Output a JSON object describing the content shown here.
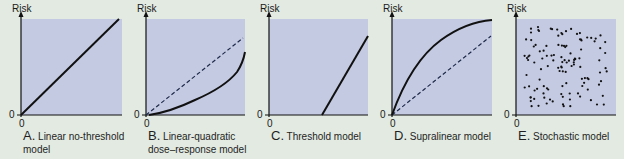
{
  "figure": {
    "colors": {
      "background": "#e2eae1",
      "plot_fill": "#c4cae2",
      "line": "#111111",
      "dashed_reference": "#1e2a4a"
    },
    "panels": [
      {
        "letter": "A.",
        "title_line1": "Linear no-threshold",
        "title_line2": "model",
        "ylabel": "Risk",
        "y_tick": "0",
        "x_tick": "0"
      },
      {
        "letter": "B.",
        "title_line1": "Linear-quadratic",
        "title_line2": "dose–response model",
        "ylabel": "Risk",
        "y_tick": "0",
        "x_tick": "0"
      },
      {
        "letter": "C.",
        "title_line1": "Threshold model",
        "title_line2": "",
        "ylabel": "Risk",
        "y_tick": "0",
        "x_tick": "0"
      },
      {
        "letter": "D.",
        "title_line1": "Supralinear model",
        "title_line2": "",
        "ylabel": "Risk",
        "y_tick": "0",
        "x_tick": "0"
      },
      {
        "letter": "E.",
        "title_line1": "Stochastic model",
        "title_line2": "",
        "ylabel": "Risk",
        "y_tick": "0",
        "x_tick": "0"
      }
    ]
  },
  "chart_data": [
    {
      "type": "line",
      "title": "A. Linear no-threshold model",
      "xlabel": "",
      "ylabel": "Risk",
      "xlim": [
        0,
        1
      ],
      "ylim": [
        0,
        1
      ],
      "series": [
        {
          "name": "risk",
          "style": "solid",
          "x": [
            0,
            1
          ],
          "y": [
            0,
            1
          ]
        }
      ]
    },
    {
      "type": "line",
      "title": "B. Linear-quadratic dose–response model",
      "xlabel": "",
      "ylabel": "Risk",
      "xlim": [
        0,
        1
      ],
      "ylim": [
        0,
        1
      ],
      "series": [
        {
          "name": "linear reference",
          "style": "dashed",
          "x": [
            0,
            1
          ],
          "y": [
            0,
            0.84
          ]
        },
        {
          "name": "linear-quadratic",
          "style": "solid",
          "x": [
            0,
            0.1,
            0.3,
            0.5,
            0.7,
            0.85,
            0.95,
            1.0
          ],
          "y": [
            0,
            0.01,
            0.07,
            0.15,
            0.26,
            0.37,
            0.48,
            0.6
          ]
        }
      ]
    },
    {
      "type": "line",
      "title": "C. Threshold model",
      "xlabel": "",
      "ylabel": "Risk",
      "xlim": [
        0,
        1
      ],
      "ylim": [
        0,
        1
      ],
      "series": [
        {
          "name": "risk",
          "style": "solid",
          "x": [
            0,
            0.55,
            1.0
          ],
          "y": [
            0,
            0,
            0.84
          ]
        }
      ]
    },
    {
      "type": "line",
      "title": "D. Supralinear model",
      "xlabel": "",
      "ylabel": "Risk",
      "xlim": [
        0,
        1
      ],
      "ylim": [
        0,
        1
      ],
      "series": [
        {
          "name": "linear reference",
          "style": "dashed",
          "x": [
            0,
            1
          ],
          "y": [
            0,
            0.84
          ]
        },
        {
          "name": "supralinear",
          "style": "solid",
          "x": [
            0,
            0.2,
            0.4,
            0.6,
            0.8,
            1.0
          ],
          "y": [
            0,
            0.42,
            0.7,
            0.88,
            0.97,
            1.0
          ]
        }
      ]
    },
    {
      "type": "scatter",
      "title": "E. Stochastic model",
      "xlabel": "",
      "ylabel": "Risk",
      "xlim": [
        0,
        1
      ],
      "ylim": [
        0,
        1
      ],
      "series": [
        {
          "name": "random events",
          "points_note": "~120 randomly scattered points filling the plot area",
          "count": 120
        }
      ]
    }
  ]
}
